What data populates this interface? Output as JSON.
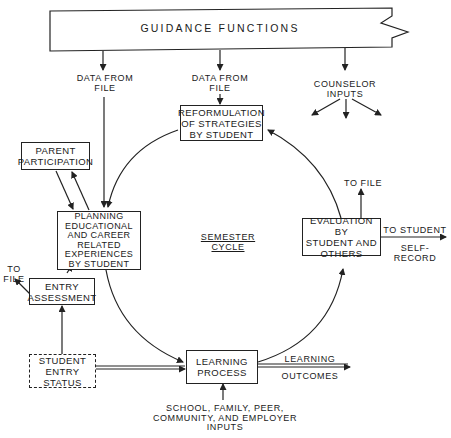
{
  "banner": {
    "title": "GUIDANCE FUNCTIONS"
  },
  "labels": {
    "data_from_file_left": "DATA FROM\nFILE",
    "data_from_file_center": "DATA FROM\nFILE",
    "counselor_inputs": "COUNSELOR\nINPUTS",
    "semester_cycle_1": "SEMESTER",
    "semester_cycle_2": "CYCLE",
    "to_file_top": "TO FILE",
    "to_student": "TO STUDENT",
    "self_record": "SELF-RECORD",
    "to_file_left": "TO\nFILE",
    "learning": "LEARNING",
    "outcomes": "OUTCOMES",
    "external_inputs": "SCHOOL, FAMILY, PEER,\nCOMMUNITY, AND EMPLOYER\nINPUTS"
  },
  "boxes": {
    "reformulation": "REFORMULATION\nOF STRATEGIES\nBY STUDENT",
    "parent": "PARENT\nPARTICIPATION",
    "planning": "PLANNING\nEDUCATIONAL\nAND CAREER\nRELATED\nEXPERIENCES\nBY STUDENT",
    "evaluation": "EVALUATION BY\nSTUDENT AND\nOTHERS",
    "entry_assessment": "ENTRY\nASSESSMENT",
    "entry_status": "STUDENT\nENTRY\nSTATUS",
    "learning_process": "LEARNING\nPROCESS"
  }
}
